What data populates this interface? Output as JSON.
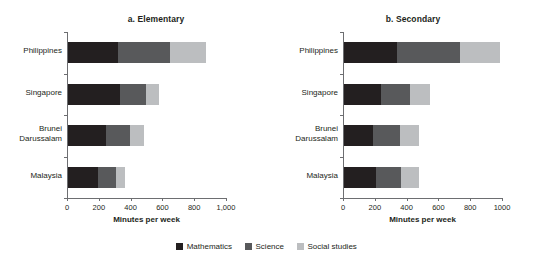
{
  "legend": {
    "items": [
      {
        "label": "Mathematics",
        "color": "#231f20",
        "key": "math"
      },
      {
        "label": "Science",
        "color": "#58595b",
        "key": "sci"
      },
      {
        "label": "Social studies",
        "color": "#bcbec0",
        "key": "soc"
      }
    ]
  },
  "chart_data": [
    {
      "type": "bar",
      "orientation": "horizontal",
      "stacked": true,
      "title": "a.  Elementary",
      "panel": "a",
      "xlabel": "Minutes per week",
      "ylabel": "",
      "xlim": [
        0,
        1000
      ],
      "xticks": [
        0,
        200,
        400,
        600,
        800,
        1000
      ],
      "xtick_labels": [
        "0",
        "200",
        "400",
        "600",
        "800",
        "1,000"
      ],
      "grid": false,
      "legend_position": "bottom-center-shared",
      "categories": [
        "Philippines",
        "Singapore",
        "Brunei Darussalam",
        "Malaysia"
      ],
      "series": [
        {
          "name": "Mathematics",
          "color": "#231f20",
          "values": [
            316,
            328,
            240,
            190
          ]
        },
        {
          "name": "Science",
          "color": "#58595b",
          "values": [
            328,
            164,
            150,
            110
          ]
        },
        {
          "name": "Social studies",
          "color": "#bcbec0",
          "values": [
            221,
            81,
            85,
            60
          ]
        }
      ],
      "totals": [
        865,
        573,
        475,
        360
      ]
    },
    {
      "type": "bar",
      "orientation": "horizontal",
      "stacked": true,
      "title": "b.  Secondary",
      "panel": "b",
      "xlabel": "Minutes per week",
      "ylabel": "",
      "xlim": [
        0,
        1000
      ],
      "xticks": [
        0,
        200,
        400,
        600,
        800,
        1000
      ],
      "xtick_labels": [
        "0",
        "200",
        "400",
        "600",
        "800",
        "1000"
      ],
      "grid": false,
      "legend_position": "bottom-center-shared",
      "categories": [
        "Philippines",
        "Singapore",
        "Brunei Darussalam",
        "Malaysia"
      ],
      "series": [
        {
          "name": "Mathematics",
          "color": "#231f20",
          "values": [
            335,
            230,
            180,
            200
          ]
        },
        {
          "name": "Science",
          "color": "#58595b",
          "values": [
            392,
            185,
            170,
            160
          ]
        },
        {
          "name": "Social studies",
          "color": "#bcbec0",
          "values": [
            252,
            125,
            120,
            110
          ]
        }
      ],
      "totals": [
        979,
        540,
        470,
        470
      ]
    }
  ]
}
